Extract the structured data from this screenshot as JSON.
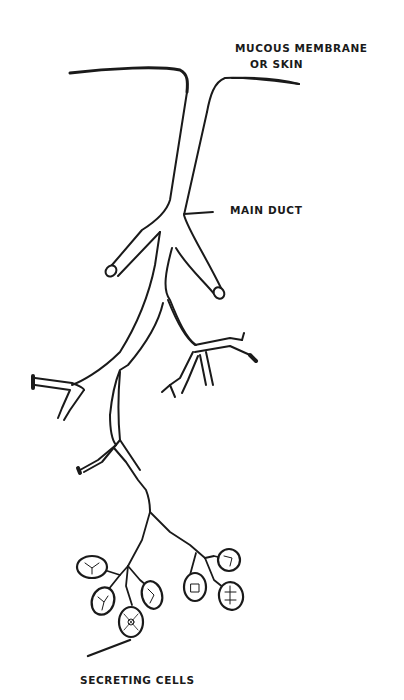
{
  "diagram": {
    "labels": {
      "mucous_membrane_line1": "MUCOUS MEMBRANE",
      "mucous_membrane_line2": "OR SKIN",
      "main_duct": "MAIN DUCT",
      "secreting_cells": "SECRETING CELLS"
    },
    "parts": [
      {
        "id": "surface",
        "label": "Mucous membrane or skin"
      },
      {
        "id": "main-duct",
        "label": "Main duct"
      },
      {
        "id": "branch-ducts",
        "label": "Branching ducts"
      },
      {
        "id": "secreting-cells",
        "label": "Secreting cells (acini)"
      }
    ],
    "colors": {
      "ink": "#1a1a1a",
      "background": "#ffffff"
    }
  }
}
